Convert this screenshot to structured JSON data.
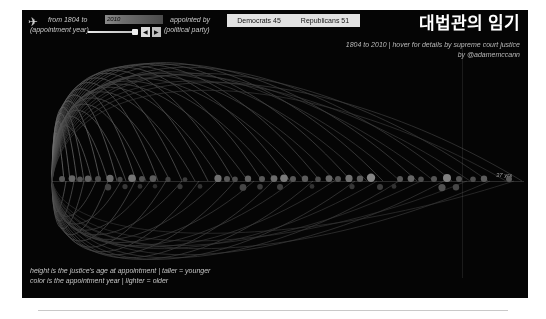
{
  "page": {
    "background_color": "#ffffff",
    "panel_background_color": "#050505"
  },
  "controls": {
    "twitter_icon_glyph": "✈",
    "year_caption_line1": "from 1804 to",
    "year_caption_line2": "(appointment year)",
    "year_value": "2010",
    "slider_prev_label": "◀",
    "slider_next_label": "▶",
    "party_caption_line1": "appointed by",
    "party_caption_line2": "(political party)",
    "party_democrats_label": "Democrats 45",
    "party_republicans_label": "Republicans 51"
  },
  "header": {
    "title": "대법관의 임기",
    "subtitle_line1": "1804 to 2010 | hover for details by supreme court justice",
    "subtitle_line2": "by @adamemccann"
  },
  "legend": {
    "line1": "height is the justice's age at appointment | taller = younger",
    "line2": "color is the appointment year | lighter = older"
  },
  "axis": {
    "end_label": "37 yrs"
  },
  "chart_data": {
    "type": "line",
    "title": "대법관의 임기",
    "subtitle": "1804 to 2010 | hover for details by supreme court justice",
    "xlabel": "appointment year",
    "ylabel": "age at appointment",
    "xlim": [
      1804,
      2010
    ],
    "grid": false,
    "legend_position": "bottom-left",
    "baseline_y": 171,
    "origin_x": 30,
    "annotations": [
      "height is the justice's age at appointment | taller = younger",
      "color is the appointment year | lighter = older"
    ],
    "vertical_marker_x": 440,
    "nodes": [
      {
        "x": 40,
        "r": 3.0,
        "b": 0.34,
        "below": false
      },
      {
        "x": 50,
        "r": 3.4,
        "b": 0.4,
        "below": false
      },
      {
        "x": 58,
        "r": 2.8,
        "b": 0.33,
        "below": false
      },
      {
        "x": 66,
        "r": 3.2,
        "b": 0.38,
        "below": false
      },
      {
        "x": 76,
        "r": 3.0,
        "b": 0.3,
        "below": false
      },
      {
        "x": 88,
        "r": 3.6,
        "b": 0.42,
        "below": false
      },
      {
        "x": 98,
        "r": 2.6,
        "b": 0.28,
        "below": false
      },
      {
        "x": 110,
        "r": 3.8,
        "b": 0.46,
        "below": false
      },
      {
        "x": 120,
        "r": 3.0,
        "b": 0.32,
        "below": false
      },
      {
        "x": 131,
        "r": 3.4,
        "b": 0.36,
        "below": false
      },
      {
        "x": 146,
        "r": 2.6,
        "b": 0.26,
        "below": false
      },
      {
        "x": 163,
        "r": 2.4,
        "b": 0.24,
        "below": false
      },
      {
        "x": 196,
        "r": 3.6,
        "b": 0.44,
        "below": false
      },
      {
        "x": 205,
        "r": 3.0,
        "b": 0.34,
        "below": false
      },
      {
        "x": 213,
        "r": 2.8,
        "b": 0.3,
        "below": false
      },
      {
        "x": 226,
        "r": 3.2,
        "b": 0.38,
        "below": false
      },
      {
        "x": 240,
        "r": 3.0,
        "b": 0.35,
        "below": false
      },
      {
        "x": 252,
        "r": 3.4,
        "b": 0.42,
        "below": false
      },
      {
        "x": 262,
        "r": 3.8,
        "b": 0.48,
        "below": false
      },
      {
        "x": 271,
        "r": 3.0,
        "b": 0.34,
        "below": false
      },
      {
        "x": 283,
        "r": 3.2,
        "b": 0.36,
        "below": false
      },
      {
        "x": 296,
        "r": 2.8,
        "b": 0.3,
        "below": false
      },
      {
        "x": 307,
        "r": 3.4,
        "b": 0.4,
        "below": false
      },
      {
        "x": 316,
        "r": 3.0,
        "b": 0.33,
        "below": false
      },
      {
        "x": 327,
        "r": 3.6,
        "b": 0.44,
        "below": false
      },
      {
        "x": 338,
        "r": 3.2,
        "b": 0.36,
        "below": false
      },
      {
        "x": 349,
        "r": 4.2,
        "b": 0.52,
        "below": false
      },
      {
        "x": 378,
        "r": 3.0,
        "b": 0.34,
        "below": false
      },
      {
        "x": 389,
        "r": 3.4,
        "b": 0.4,
        "below": false
      },
      {
        "x": 399,
        "r": 2.8,
        "b": 0.3,
        "below": false
      },
      {
        "x": 412,
        "r": 3.0,
        "b": 0.33,
        "below": false
      },
      {
        "x": 425,
        "r": 4.0,
        "b": 0.5,
        "below": false
      },
      {
        "x": 437,
        "r": 3.0,
        "b": 0.32,
        "below": false
      },
      {
        "x": 451,
        "r": 2.8,
        "b": 0.3,
        "below": false
      },
      {
        "x": 462,
        "r": 3.2,
        "b": 0.36,
        "below": false
      },
      {
        "x": 487,
        "r": 3.0,
        "b": 0.34,
        "below": false
      },
      {
        "x": 86,
        "r": 3.2,
        "b": 0.26,
        "below": true
      },
      {
        "x": 103,
        "r": 2.6,
        "b": 0.22,
        "below": true
      },
      {
        "x": 118,
        "r": 2.4,
        "b": 0.2,
        "below": true
      },
      {
        "x": 133,
        "r": 2.2,
        "b": 0.18,
        "below": true
      },
      {
        "x": 158,
        "r": 2.6,
        "b": 0.22,
        "below": true
      },
      {
        "x": 178,
        "r": 2.4,
        "b": 0.2,
        "below": true
      },
      {
        "x": 221,
        "r": 3.4,
        "b": 0.28,
        "below": true
      },
      {
        "x": 238,
        "r": 2.8,
        "b": 0.24,
        "below": true
      },
      {
        "x": 258,
        "r": 3.0,
        "b": 0.25,
        "below": true
      },
      {
        "x": 290,
        "r": 2.4,
        "b": 0.2,
        "below": true
      },
      {
        "x": 330,
        "r": 2.6,
        "b": 0.22,
        "below": true
      },
      {
        "x": 358,
        "r": 3.0,
        "b": 0.24,
        "below": true
      },
      {
        "x": 372,
        "r": 2.4,
        "b": 0.2,
        "below": true
      },
      {
        "x": 420,
        "r": 3.6,
        "b": 0.32,
        "below": true
      },
      {
        "x": 434,
        "r": 3.2,
        "b": 0.28,
        "below": true
      }
    ],
    "arcs_above": [
      {
        "end_x": 42,
        "height": 62,
        "b": 0.5
      },
      {
        "end_x": 48,
        "height": 78,
        "b": 0.46
      },
      {
        "end_x": 55,
        "height": 88,
        "b": 0.44
      },
      {
        "end_x": 62,
        "height": 96,
        "b": 0.42
      },
      {
        "end_x": 70,
        "height": 72,
        "b": 0.4
      },
      {
        "end_x": 78,
        "height": 104,
        "b": 0.44
      },
      {
        "end_x": 86,
        "height": 84,
        "b": 0.38
      },
      {
        "end_x": 95,
        "height": 112,
        "b": 0.42
      },
      {
        "end_x": 104,
        "height": 92,
        "b": 0.36
      },
      {
        "end_x": 114,
        "height": 120,
        "b": 0.4
      },
      {
        "end_x": 124,
        "height": 100,
        "b": 0.34
      },
      {
        "end_x": 136,
        "height": 128,
        "b": 0.38
      },
      {
        "end_x": 148,
        "height": 108,
        "b": 0.33
      },
      {
        "end_x": 160,
        "height": 134,
        "b": 0.36
      },
      {
        "end_x": 173,
        "height": 116,
        "b": 0.32
      },
      {
        "end_x": 186,
        "height": 140,
        "b": 0.35
      },
      {
        "end_x": 199,
        "height": 122,
        "b": 0.31
      },
      {
        "end_x": 212,
        "height": 144,
        "b": 0.34
      },
      {
        "end_x": 226,
        "height": 126,
        "b": 0.3
      },
      {
        "end_x": 240,
        "height": 148,
        "b": 0.33
      },
      {
        "end_x": 254,
        "height": 130,
        "b": 0.29
      },
      {
        "end_x": 268,
        "height": 150,
        "b": 0.32
      },
      {
        "end_x": 283,
        "height": 134,
        "b": 0.28
      },
      {
        "end_x": 298,
        "height": 152,
        "b": 0.31
      },
      {
        "end_x": 313,
        "height": 138,
        "b": 0.27
      },
      {
        "end_x": 329,
        "height": 153,
        "b": 0.3
      },
      {
        "end_x": 345,
        "height": 140,
        "b": 0.26
      },
      {
        "end_x": 361,
        "height": 154,
        "b": 0.29
      },
      {
        "end_x": 378,
        "height": 142,
        "b": 0.25
      },
      {
        "end_x": 395,
        "height": 152,
        "b": 0.28
      },
      {
        "end_x": 412,
        "height": 138,
        "b": 0.24
      },
      {
        "end_x": 430,
        "height": 148,
        "b": 0.26
      },
      {
        "end_x": 448,
        "height": 130,
        "b": 0.23
      },
      {
        "end_x": 466,
        "height": 140,
        "b": 0.25
      },
      {
        "end_x": 484,
        "height": 118,
        "b": 0.22
      },
      {
        "end_x": 500,
        "height": 128,
        "b": 0.24
      }
    ],
    "arcs_below": [
      {
        "end_x": 44,
        "height": 40,
        "b": 0.4
      },
      {
        "end_x": 52,
        "height": 52,
        "b": 0.36
      },
      {
        "end_x": 62,
        "height": 62,
        "b": 0.34
      },
      {
        "end_x": 74,
        "height": 46,
        "b": 0.32
      },
      {
        "end_x": 86,
        "height": 70,
        "b": 0.34
      },
      {
        "end_x": 99,
        "height": 56,
        "b": 0.3
      },
      {
        "end_x": 113,
        "height": 78,
        "b": 0.32
      },
      {
        "end_x": 128,
        "height": 64,
        "b": 0.28
      },
      {
        "end_x": 144,
        "height": 86,
        "b": 0.3
      },
      {
        "end_x": 160,
        "height": 70,
        "b": 0.27
      },
      {
        "end_x": 177,
        "height": 92,
        "b": 0.29
      },
      {
        "end_x": 195,
        "height": 76,
        "b": 0.26
      },
      {
        "end_x": 213,
        "height": 96,
        "b": 0.28
      },
      {
        "end_x": 232,
        "height": 80,
        "b": 0.25
      },
      {
        "end_x": 251,
        "height": 100,
        "b": 0.27
      },
      {
        "end_x": 271,
        "height": 84,
        "b": 0.24
      },
      {
        "end_x": 291,
        "height": 102,
        "b": 0.26
      },
      {
        "end_x": 312,
        "height": 86,
        "b": 0.23
      },
      {
        "end_x": 333,
        "height": 102,
        "b": 0.25
      },
      {
        "end_x": 355,
        "height": 88,
        "b": 0.22
      },
      {
        "end_x": 377,
        "height": 100,
        "b": 0.24
      },
      {
        "end_x": 399,
        "height": 84,
        "b": 0.21
      },
      {
        "end_x": 422,
        "height": 96,
        "b": 0.23
      },
      {
        "end_x": 445,
        "height": 78,
        "b": 0.2
      },
      {
        "end_x": 468,
        "height": 88,
        "b": 0.22
      },
      {
        "end_x": 492,
        "height": 68,
        "b": 0.2
      }
    ]
  }
}
